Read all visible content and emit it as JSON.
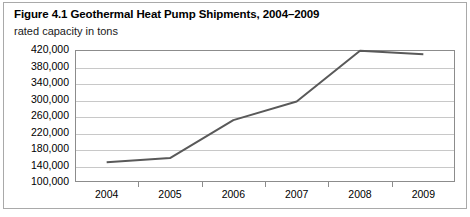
{
  "figure": {
    "title": "Figure 4.1 Geothermal Heat Pump Shipments, 2004–2009",
    "subtitle": "rated capacity in tons"
  },
  "chart_data": {
    "type": "line",
    "title": "Figure 4.1 Geothermal Heat Pump Shipments, 2004–2009",
    "subtitle": "rated capacity in tons",
    "xlabel": "",
    "ylabel": "rated capacity in tons",
    "categories": [
      "2004",
      "2005",
      "2006",
      "2007",
      "2008",
      "2009"
    ],
    "values": [
      148000,
      158000,
      250000,
      295000,
      418000,
      410000
    ],
    "series": [
      {
        "name": "Geothermal heat pump shipments",
        "values": [
          148000,
          158000,
          250000,
          295000,
          418000,
          410000
        ]
      }
    ],
    "ylim": [
      100000,
      420000
    ],
    "ytick_labels": [
      "420,000",
      "380,000",
      "340,000",
      "300,000",
      "260,000",
      "220,000",
      "180,000",
      "140,000",
      "100,000"
    ],
    "ytick_values": [
      420000,
      380000,
      340000,
      300000,
      260000,
      220000,
      180000,
      140000,
      100000
    ],
    "ytick_step": 40000,
    "grid": true,
    "grid_axis": "y",
    "legend": false,
    "legend_position": "none",
    "line_color": "#595959",
    "grid_color": "#c8c8c8",
    "axis_color": "#8c8c8c",
    "background_color": "#ffffff"
  }
}
